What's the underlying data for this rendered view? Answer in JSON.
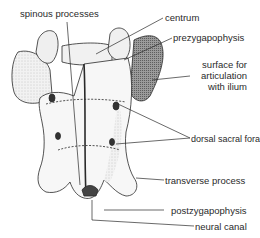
{
  "diagram": {
    "labels": {
      "spinous_processes": "spinous processes",
      "centrum": "centrum",
      "prezygapophysis": "prezygapophysis",
      "surface_articulation_1": "surface for",
      "surface_articulation_2": "articulation",
      "surface_articulation_3": "with ilium",
      "dorsal_sacral_foramina": "dorsal sacral foramina",
      "transverse_process": "transverse process",
      "postzygapophysis": "postzygapophysis",
      "neural_canal": "neural canal"
    },
    "colors": {
      "line": "#2a2a2a",
      "bone_fill": "#f4f4f4",
      "shade": "#8a8a8a",
      "background": "#ffffff"
    }
  }
}
